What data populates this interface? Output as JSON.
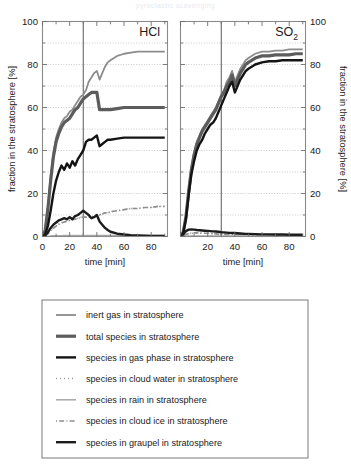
{
  "figure": {
    "faint_title": "pyroclastic scavenging",
    "axis": {
      "ylabel": "fraction in the stratosphere [%]",
      "xlabel": "time [min]",
      "ylim": [
        0,
        100
      ],
      "xlim": [
        0,
        92
      ],
      "yticks": [
        0,
        20,
        40,
        60,
        80,
        100
      ],
      "yticklabels": [
        "0",
        "20",
        "40",
        "60",
        "80",
        "100"
      ],
      "xticks": [
        0,
        20,
        40,
        60,
        80
      ],
      "xticklabels": [
        "0",
        "20",
        "40",
        "60",
        "80"
      ],
      "xminor": [
        10,
        30,
        50,
        70,
        90
      ],
      "grid": "horizontal dotted at every 10%",
      "vertical_marker_x": 30
    },
    "panels": [
      {
        "name": "HCl",
        "label": "HCl",
        "subscript": ""
      },
      {
        "name": "SO2",
        "label": "SO",
        "subscript": "2"
      }
    ],
    "legend": {
      "position": "below-plots",
      "items": [
        {
          "label": "inert gas in stratosphere",
          "color": "#8c8c8c",
          "width": 1.8,
          "dash": "none"
        },
        {
          "label": "total species in stratosphere",
          "color": "#5c5c5c",
          "width": 3.2,
          "dash": "none"
        },
        {
          "label": "species in gas phase in stratosphere",
          "color": "#141414",
          "width": 2.4,
          "dash": "none"
        },
        {
          "label": "species in cloud water in stratosphere",
          "color": "#9a9a9a",
          "width": 1.5,
          "dash": "1,3"
        },
        {
          "label": "species in rain in stratosphere",
          "color": "#a8a8a8",
          "width": 1.5,
          "dash": "none"
        },
        {
          "label": "species in cloud ice in stratosphere",
          "color": "#8f8f8f",
          "width": 1.6,
          "dash": "1,2.2,5,2.2"
        },
        {
          "label": "species in graupel in stratosphere",
          "color": "#1c1c1c",
          "width": 2.4,
          "dash": "none"
        }
      ]
    }
  },
  "chart_data": {
    "type": "line",
    "title": "",
    "xlabel": "time [min]",
    "ylabel": "fraction in the stratosphere [%]",
    "xlim": [
      0,
      92
    ],
    "ylim": [
      0,
      100
    ],
    "grid": true,
    "legend_position": "bottom",
    "annotations": [
      {
        "text": "HCl",
        "panel": "HCl"
      },
      {
        "text": "SO2",
        "panel": "SO2"
      },
      {
        "text": "vertical line at t = 30 min",
        "panel": "both"
      }
    ],
    "panels": [
      {
        "panel": "HCl",
        "x": [
          0,
          2,
          4,
          6,
          8,
          10,
          12,
          14,
          16,
          18,
          20,
          22,
          24,
          26,
          28,
          30,
          32,
          34,
          36,
          38,
          40,
          42,
          44,
          46,
          48,
          50,
          55,
          60,
          65,
          70,
          75,
          80,
          85,
          90
        ],
        "series": [
          {
            "name": "inert gas in stratosphere",
            "values": [
              0,
              3,
              14,
              28,
              39,
              46,
              50,
              53,
              55,
              56,
              58,
              59,
              61,
              63,
              65,
              66,
              68,
              72,
              74,
              76,
              77,
              73,
              76,
              79,
              81,
              82,
              84,
              85,
              85.5,
              86,
              86,
              86,
              86,
              86
            ]
          },
          {
            "name": "total species in stratosphere",
            "values": [
              0,
              3,
              13,
              26,
              37,
              44,
              48,
              51,
              53,
              54,
              55,
              57,
              59,
              60,
              62,
              64,
              65,
              66,
              67,
              67,
              67,
              59,
              59,
              59,
              59,
              59,
              59.5,
              60,
              60,
              60,
              60,
              60,
              60,
              60
            ]
          },
          {
            "name": "species in gas phase in stratosphere",
            "values": [
              0,
              1,
              5,
              12,
              20,
              26,
              30,
              33,
              31,
              34,
              32,
              35,
              33,
              36,
              38,
              40,
              44,
              45,
              45,
              46,
              47,
              42,
              43,
              44,
              45,
              45,
              45.5,
              46,
              46,
              46,
              46,
              46,
              46,
              46
            ]
          },
          {
            "name": "species in cloud water in stratosphere",
            "values": [
              0,
              0.4,
              1.5,
              3,
              4,
              5,
              6,
              6.5,
              7,
              7,
              7.5,
              8,
              8,
              8.5,
              9,
              9,
              9,
              9,
              9,
              9,
              9.5,
              10,
              10.5,
              11,
              11,
              11.5,
              12,
              12.5,
              13,
              13,
              13.5,
              13.5,
              14,
              14
            ]
          },
          {
            "name": "species in rain in stratosphere",
            "values": [
              0,
              0,
              0,
              0.2,
              0.3,
              0.3,
              0.4,
              0.4,
              0.5,
              0.5,
              0.5,
              0.5,
              0.5,
              0.5,
              0.5,
              0.5,
              0.5,
              0.5,
              0.5,
              0.5,
              0.5,
              0.5,
              0.5,
              0.5,
              0.5,
              0.5,
              0.5,
              0.5,
              0.5,
              0.5,
              0.5,
              0.5,
              0.5,
              0.5
            ]
          },
          {
            "name": "species in cloud ice in stratosphere",
            "values": [
              0,
              0.3,
              1.2,
              2.6,
              3.8,
              4.8,
              5.6,
              6.2,
              6.8,
              7,
              7.4,
              7.8,
              8,
              8.4,
              8.8,
              9,
              9,
              9,
              9,
              9,
              9.4,
              10,
              10.5,
              11,
              11,
              11.5,
              12,
              12.5,
              13,
              13,
              13.5,
              13.5,
              14,
              14
            ]
          },
          {
            "name": "species in graupel in stratosphere",
            "values": [
              0,
              0.5,
              2,
              4,
              5.5,
              6.5,
              7.5,
              8,
              8.5,
              8,
              9,
              8,
              9.5,
              10,
              11,
              12,
              11,
              10,
              8.5,
              9,
              10,
              7,
              5.5,
              4,
              3,
              2.2,
              1.3,
              0.9,
              0.6,
              0.5,
              0.4,
              0.3,
              0.3,
              0.2
            ]
          }
        ]
      },
      {
        "panel": "SO2",
        "x": [
          0,
          2,
          4,
          6,
          8,
          10,
          12,
          14,
          16,
          18,
          20,
          22,
          24,
          26,
          28,
          30,
          32,
          34,
          36,
          38,
          40,
          42,
          44,
          46,
          48,
          50,
          55,
          60,
          65,
          70,
          75,
          80,
          85,
          90
        ],
        "series": [
          {
            "name": "inert gas in stratosphere",
            "values": [
              0,
              2,
              10,
              22,
              32,
              39,
              44,
              47,
              50,
              52,
              54,
              56,
              58,
              60,
              63,
              66,
              68,
              72,
              74,
              77,
              72,
              75,
              78,
              80,
              82,
              83,
              85,
              86,
              86,
              86.5,
              86.5,
              87,
              87,
              87
            ]
          },
          {
            "name": "total species in stratosphere",
            "values": [
              0,
              2,
              9,
              21,
              31,
              38,
              43,
              46,
              49,
              51,
              53,
              55,
              57,
              59,
              62,
              65,
              67,
              70,
              72,
              75,
              70,
              73,
              76,
              78,
              80,
              81,
              83,
              84,
              84,
              84.5,
              84.5,
              84.5,
              85,
              85
            ]
          },
          {
            "name": "species in gas phase in stratosphere",
            "values": [
              0,
              1.5,
              8,
              19,
              29,
              35,
              40,
              43,
              45,
              48,
              50,
              52,
              53,
              55,
              58,
              61,
              64,
              67,
              70,
              72,
              67,
              70,
              73,
              75,
              77,
              78,
              80,
              81,
              81.5,
              81.5,
              82,
              82,
              82,
              82
            ]
          },
          {
            "name": "species in cloud water in stratosphere",
            "values": [
              0,
              0.3,
              0.8,
              1.2,
              1.4,
              1.5,
              1.5,
              1.5,
              1.5,
              1.5,
              1.5,
              1.4,
              1.3,
              1.2,
              1.1,
              1,
              1,
              1,
              1,
              1,
              1,
              0.9,
              0.8,
              0.8,
              0.8,
              0.8,
              0.7,
              0.7,
              0.7,
              0.6,
              0.6,
              0.6,
              0.6,
              0.6
            ]
          },
          {
            "name": "species in rain in stratosphere",
            "values": [
              0,
              0,
              0.1,
              0.2,
              0.2,
              0.2,
              0.2,
              0.2,
              0.2,
              0.2,
              0.2,
              0.2,
              0.2,
              0.2,
              0.2,
              0.2,
              0.2,
              0.2,
              0.2,
              0.2,
              0.2,
              0.2,
              0.2,
              0.2,
              0.2,
              0.2,
              0.2,
              0.2,
              0.2,
              0.2,
              0.2,
              0.2,
              0.2,
              0.2
            ]
          },
          {
            "name": "species in cloud ice in stratosphere",
            "values": [
              0,
              0.3,
              0.9,
              1.4,
              1.6,
              1.7,
              1.7,
              1.6,
              1.6,
              1.5,
              1.5,
              1.4,
              1.3,
              1.2,
              1.1,
              1,
              1,
              1,
              1,
              1,
              1.1,
              1,
              0.9,
              0.9,
              0.9,
              0.9,
              0.8,
              0.8,
              0.8,
              0.7,
              0.7,
              0.7,
              0.7,
              0.7
            ]
          },
          {
            "name": "species in graupel in stratosphere",
            "values": [
              0,
              1,
              2.5,
              3.2,
              3.3,
              3.2,
              3,
              2.9,
              2.8,
              2.7,
              2.6,
              2.5,
              2.4,
              2.3,
              2.2,
              2,
              1.9,
              1.8,
              1.7,
              1.6,
              1.6,
              1.5,
              1.4,
              1.3,
              1.2,
              1.2,
              1.1,
              1,
              1,
              0.9,
              0.9,
              0.8,
              0.8,
              0.8
            ]
          }
        ]
      }
    ]
  }
}
